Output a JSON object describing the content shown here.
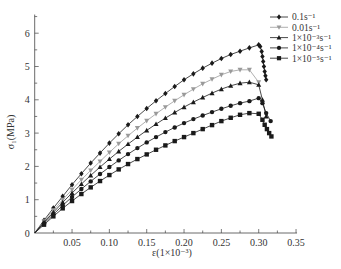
{
  "chart_data": {
    "type": "line",
    "title": "",
    "xlabel": "ε(1×10⁻³)",
    "ylabel": "σ₁(MPa)",
    "xlim": [
      0,
      0.35
    ],
    "ylim": [
      0,
      6.5
    ],
    "x_ticks": [
      0.05,
      0.1,
      0.15,
      0.2,
      0.25,
      0.3,
      0.35
    ],
    "x_tick_labels": [
      "0.05",
      "0.10",
      "0.15",
      "0.20",
      "0.25",
      "0.30",
      "0.35"
    ],
    "y_ticks": [
      0,
      1,
      2,
      3,
      4,
      5,
      6
    ],
    "y_tick_labels": [
      "0",
      "1",
      "2",
      "3",
      "4",
      "5",
      "6"
    ],
    "grid": false,
    "legend_position": "top-right",
    "series": [
      {
        "name": "0.1s⁻¹",
        "marker": "diamond",
        "color": "#1a1a1a",
        "x": [
          0,
          0.0125,
          0.025,
          0.0375,
          0.05,
          0.0625,
          0.075,
          0.0875,
          0.1,
          0.1125,
          0.125,
          0.1375,
          0.15,
          0.1625,
          0.175,
          0.1875,
          0.2,
          0.2125,
          0.225,
          0.2375,
          0.25,
          0.2625,
          0.275,
          0.2875,
          0.3,
          0.302,
          0.304,
          0.305,
          0.306,
          0.307,
          0.308,
          0.309,
          0.31
        ],
        "y": [
          0,
          0.38,
          0.75,
          1.1,
          1.45,
          1.78,
          2.1,
          2.4,
          2.7,
          2.98,
          3.25,
          3.5,
          3.74,
          3.97,
          4.19,
          4.4,
          4.6,
          4.78,
          4.95,
          5.1,
          5.24,
          5.36,
          5.46,
          5.56,
          5.65,
          5.6,
          5.45,
          5.3,
          5.15,
          5.0,
          4.85,
          4.72,
          4.6
        ]
      },
      {
        "name": "0.01s⁻¹",
        "marker": "triangle-down",
        "color": "#9a9a9a",
        "x": [
          0,
          0.0125,
          0.025,
          0.0375,
          0.05,
          0.0625,
          0.075,
          0.0875,
          0.1,
          0.1125,
          0.125,
          0.1375,
          0.15,
          0.1625,
          0.175,
          0.1875,
          0.2,
          0.2125,
          0.225,
          0.2375,
          0.25,
          0.2625,
          0.275,
          0.2875,
          0.3
        ],
        "y": [
          0,
          0.35,
          0.68,
          1.0,
          1.3,
          1.6,
          1.88,
          2.15,
          2.42,
          2.68,
          2.92,
          3.15,
          3.37,
          3.58,
          3.78,
          3.97,
          4.15,
          4.32,
          4.48,
          4.62,
          4.75,
          4.85,
          4.9,
          4.9,
          4.53
        ]
      },
      {
        "name": "1×10⁻³s⁻¹",
        "marker": "triangle-up",
        "color": "#1a1a1a",
        "x": [
          0,
          0.0125,
          0.025,
          0.0375,
          0.05,
          0.0625,
          0.075,
          0.0875,
          0.1,
          0.1125,
          0.125,
          0.1375,
          0.15,
          0.1625,
          0.175,
          0.1875,
          0.2,
          0.2125,
          0.225,
          0.2375,
          0.25,
          0.2625,
          0.275,
          0.2875,
          0.3,
          0.305,
          0.31
        ],
        "y": [
          0,
          0.32,
          0.62,
          0.92,
          1.2,
          1.47,
          1.73,
          1.98,
          2.22,
          2.45,
          2.67,
          2.88,
          3.08,
          3.27,
          3.45,
          3.62,
          3.78,
          3.93,
          4.07,
          4.2,
          4.32,
          4.42,
          4.5,
          4.53,
          4.45,
          4.0,
          3.5
        ]
      },
      {
        "name": "1×10⁻⁴s⁻¹",
        "marker": "circle",
        "color": "#1a1a1a",
        "x": [
          0,
          0.0125,
          0.025,
          0.0375,
          0.05,
          0.0625,
          0.075,
          0.0875,
          0.1,
          0.1125,
          0.125,
          0.1375,
          0.15,
          0.1625,
          0.175,
          0.1875,
          0.2,
          0.2125,
          0.225,
          0.2375,
          0.25,
          0.2625,
          0.275,
          0.2875,
          0.3,
          0.305,
          0.31,
          0.316
        ],
        "y": [
          0,
          0.29,
          0.56,
          0.83,
          1.08,
          1.32,
          1.55,
          1.77,
          1.98,
          2.18,
          2.37,
          2.55,
          2.72,
          2.88,
          3.03,
          3.17,
          3.3,
          3.42,
          3.53,
          3.63,
          3.73,
          3.82,
          3.9,
          3.96,
          4.05,
          3.9,
          3.6,
          3.36
        ]
      },
      {
        "name": "1×10⁻⁵s⁻¹",
        "marker": "square",
        "color": "#1a1a1a",
        "x": [
          0,
          0.0125,
          0.025,
          0.0375,
          0.05,
          0.0625,
          0.075,
          0.0875,
          0.1,
          0.1125,
          0.125,
          0.1375,
          0.15,
          0.1625,
          0.175,
          0.1875,
          0.2,
          0.2125,
          0.225,
          0.2375,
          0.25,
          0.2625,
          0.275,
          0.2875,
          0.3,
          0.305,
          0.308,
          0.311,
          0.314,
          0.317
        ],
        "y": [
          0,
          0.25,
          0.5,
          0.74,
          0.96,
          1.17,
          1.37,
          1.56,
          1.74,
          1.91,
          2.07,
          2.22,
          2.36,
          2.5,
          2.63,
          2.76,
          2.88,
          3.0,
          3.12,
          3.24,
          3.36,
          3.46,
          3.55,
          3.6,
          3.58,
          3.4,
          3.25,
          3.12,
          3.0,
          2.9
        ]
      }
    ]
  }
}
